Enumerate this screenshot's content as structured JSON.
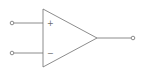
{
  "diagram": {
    "inputs": [
      {
        "label": "+",
        "name": "non-inverting"
      },
      {
        "label": "−",
        "name": "inverting"
      }
    ],
    "output": {
      "name": "output"
    },
    "colors": {
      "stroke": "#6e6e6e",
      "background": "#ffffff"
    }
  }
}
